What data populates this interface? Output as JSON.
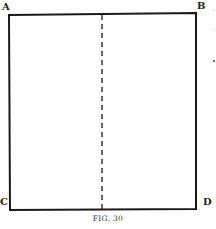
{
  "figure": {
    "caption": "FIG. 30",
    "labels": {
      "top_left": "A",
      "top_right": "B",
      "bottom_left": "C",
      "bottom_right": "D"
    },
    "shape": "square",
    "fold_line": "dashed vertical center line",
    "stroke_color": "#1a1a1a"
  },
  "margin_marks": [
    "·",
    "·",
    "·"
  ]
}
